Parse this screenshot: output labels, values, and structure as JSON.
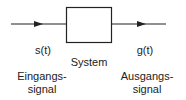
{
  "diagram": {
    "system_label": "System",
    "input": {
      "signal": "s(t)",
      "caption_line1": "Eingangs-",
      "caption_line2": "signal"
    },
    "output": {
      "signal": "g(t)",
      "caption_line1": "Ausgangs-",
      "caption_line2": "signal"
    },
    "colors": {
      "stroke": "#222222",
      "background": "#ffffff"
    }
  }
}
